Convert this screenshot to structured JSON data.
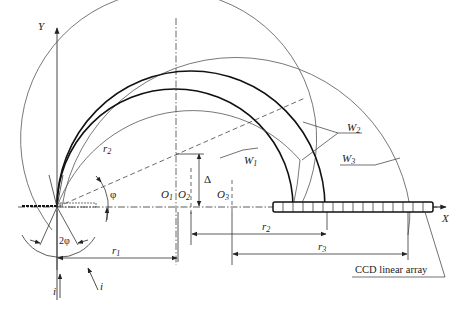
{
  "diagram": {
    "axes": {
      "x": "X",
      "y": "Y"
    },
    "centers": [
      {
        "label": "O",
        "sub": "1"
      },
      {
        "label": "O",
        "sub": "2"
      },
      {
        "label": "O",
        "sub": "3"
      }
    ],
    "radii": [
      {
        "label": "r",
        "sub": "1"
      },
      {
        "label": "r",
        "sub": "2"
      },
      {
        "label": "r",
        "sub": "2"
      },
      {
        "label": "r",
        "sub": "3"
      }
    ],
    "wavefronts": [
      {
        "label": "W",
        "sub": "1"
      },
      {
        "label": "W",
        "sub": "2"
      },
      {
        "label": "W",
        "sub": "3"
      }
    ],
    "angles": {
      "phi": "φ",
      "two_phi": "2φ"
    },
    "offset": "Δ",
    "incidence": [
      "i",
      "i"
    ],
    "sensor_label": "CCD linear array",
    "ccd_cells": 16
  }
}
